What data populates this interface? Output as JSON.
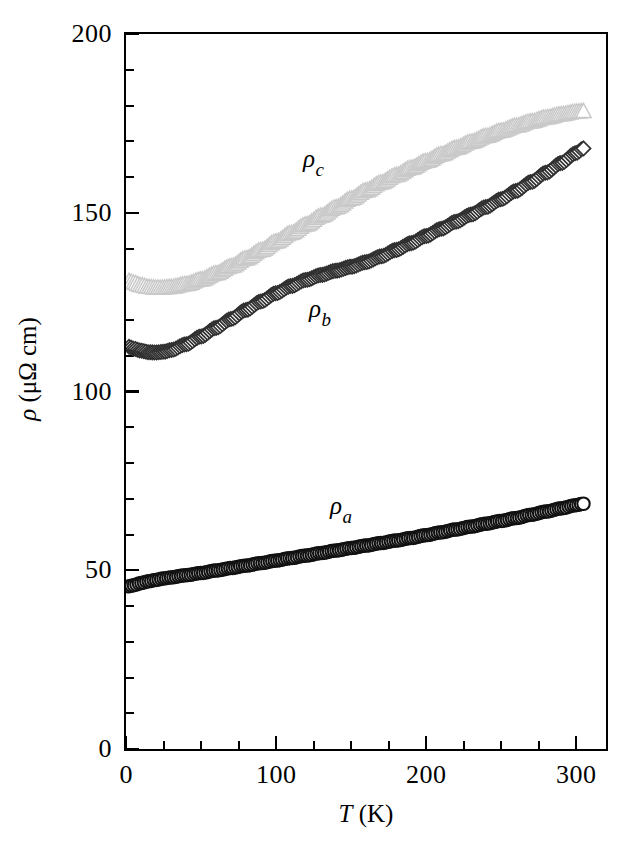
{
  "figure": {
    "kind": "scientific-plot",
    "background": "#ffffff"
  },
  "axes": {
    "x": {
      "title_italic": "T",
      "title_units": " (K)",
      "title_full": "T (K)",
      "min": 0,
      "max": 320,
      "major_ticks": [
        0,
        100,
        200,
        300
      ],
      "major_tick_labels": [
        "0",
        "100",
        "200",
        "300"
      ],
      "minor_tick_step": 25
    },
    "y": {
      "title_full": "ρ (μΩ cm)",
      "title_symbol": "ρ",
      "title_units": " (μΩ cm)",
      "min": 0,
      "max": 200,
      "major_ticks": [
        0,
        50,
        100,
        150,
        200
      ],
      "major_tick_labels": [
        "0",
        "50",
        "100",
        "150",
        "200"
      ],
      "minor_tick_step": 10
    }
  },
  "series_labels": [
    {
      "name": "rho-c-label",
      "symbol": "ρ",
      "subscript": "c",
      "x_data": 118,
      "y_data": 165
    },
    {
      "name": "rho-b-label",
      "symbol": "ρ",
      "subscript": "b",
      "x_data": 122,
      "y_data": 123
    },
    {
      "name": "rho-a-label",
      "symbol": "ρ",
      "subscript": "a",
      "x_data": 136,
      "y_data": 68
    }
  ],
  "caption_partial": "",
  "colors": {
    "axis": "#000000",
    "rho_a": "#111111",
    "rho_b": "#303030",
    "rho_c": "#c9c9c9",
    "marker_fill": "#ffffff"
  },
  "chart_data": {
    "type": "scatter",
    "title": "",
    "xlabel": "T (K)",
    "ylabel": "ρ (μΩ cm)",
    "xlim": [
      0,
      320
    ],
    "ylim": [
      0,
      200
    ],
    "grid": false,
    "legend": "inline-annotations",
    "x_major_ticks": [
      0,
      100,
      200,
      300
    ],
    "y_major_ticks": [
      0,
      50,
      100,
      150,
      200
    ],
    "x": [
      2,
      5,
      10,
      15,
      20,
      25,
      30,
      40,
      50,
      60,
      70,
      80,
      90,
      100,
      110,
      120,
      130,
      140,
      150,
      160,
      170,
      180,
      190,
      200,
      210,
      220,
      230,
      240,
      250,
      260,
      270,
      280,
      290,
      300,
      305
    ],
    "series": [
      {
        "name": "ρa",
        "marker": "open-circle",
        "color": "#111111",
        "values": [
          45.5,
          45.8,
          46.4,
          46.9,
          47.3,
          47.7,
          48.0,
          48.6,
          49.2,
          49.9,
          50.6,
          51.3,
          52.0,
          52.7,
          53.4,
          54.1,
          54.8,
          55.5,
          56.2,
          56.9,
          57.6,
          58.3,
          59.0,
          59.8,
          60.6,
          61.4,
          62.2,
          63.0,
          63.8,
          64.6,
          65.5,
          66.4,
          67.3,
          68.2,
          68.6
        ]
      },
      {
        "name": "ρb",
        "marker": "open-diamond",
        "color": "#303030",
        "values": [
          112.5,
          112.0,
          111.4,
          111.0,
          110.9,
          111.1,
          111.6,
          113.2,
          115.4,
          117.8,
          120.3,
          122.8,
          125.2,
          127.5,
          129.5,
          131.2,
          132.6,
          133.8,
          134.9,
          136.2,
          137.8,
          139.6,
          141.5,
          143.5,
          145.5,
          147.5,
          149.5,
          151.6,
          153.8,
          156.1,
          158.6,
          161.2,
          163.9,
          166.7,
          168.0
        ]
      },
      {
        "name": "ρc",
        "marker": "open-triangle",
        "color": "#c9c9c9",
        "values": [
          130.8,
          130.3,
          129.6,
          129.1,
          128.9,
          128.9,
          129.1,
          129.9,
          131.2,
          132.9,
          134.9,
          137.1,
          139.4,
          141.8,
          144.2,
          146.6,
          149.0,
          151.4,
          153.8,
          156.1,
          158.3,
          160.4,
          162.4,
          164.3,
          166.2,
          168.0,
          169.7,
          171.3,
          172.8,
          174.2,
          175.4,
          176.5,
          177.4,
          178.1,
          178.3
        ]
      }
    ]
  }
}
